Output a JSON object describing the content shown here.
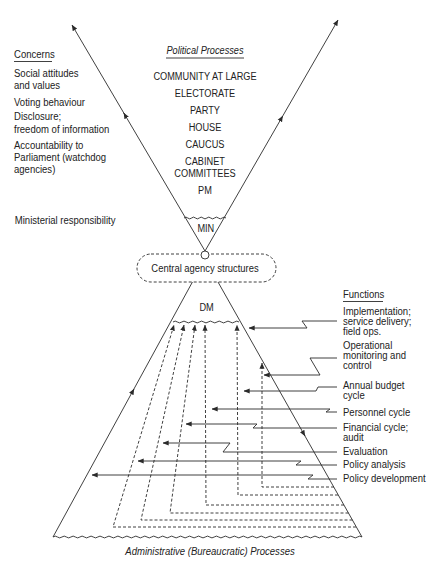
{
  "diagram": {
    "concerns": {
      "heading": "Concerns",
      "items": [
        {
          "lines": [
            "Social attitudes",
            "and values"
          ]
        },
        {
          "lines": [
            "Voting behaviour"
          ]
        },
        {
          "lines": [
            "Disclosure;",
            "freedom of information"
          ]
        },
        {
          "lines": [
            "Accountability to",
            "Parliament (watchdog",
            "agencies)"
          ]
        }
      ],
      "ministerial": "Ministerial responsibility"
    },
    "political": {
      "heading": "Political Processes",
      "levels": [
        {
          "lines": [
            "COMMUNITY AT LARGE"
          ]
        },
        {
          "lines": [
            "ELECTORATE"
          ]
        },
        {
          "lines": [
            "PARTY"
          ]
        },
        {
          "lines": [
            "HOUSE"
          ]
        },
        {
          "lines": [
            "CAUCUS"
          ]
        },
        {
          "lines": [
            "CABINET",
            "COMMITTEES"
          ]
        },
        {
          "lines": [
            "PM"
          ]
        }
      ],
      "apex": "MIN"
    },
    "central_agency": "Central agency structures",
    "administrative": {
      "apex": "DM",
      "label": "Administrative (Bureaucratic) Processes"
    },
    "functions": {
      "heading": "Functions",
      "items": [
        {
          "lines": [
            "Implementation;",
            "service delivery;",
            "field ops."
          ]
        },
        {
          "lines": [
            "Operational",
            "monitoring and",
            "control"
          ]
        },
        {
          "lines": [
            "Annual budget",
            "cycle"
          ]
        },
        {
          "lines": [
            "Personnel cycle"
          ]
        },
        {
          "lines": [
            "Financial cycle;",
            "audit"
          ]
        },
        {
          "lines": [
            "Evaluation"
          ]
        },
        {
          "lines": [
            "Policy analysis"
          ]
        },
        {
          "lines": [
            "Policy development"
          ]
        }
      ]
    },
    "colors": {
      "line": "#2b2b2b",
      "text": "#222222",
      "background": "#ffffff"
    }
  }
}
